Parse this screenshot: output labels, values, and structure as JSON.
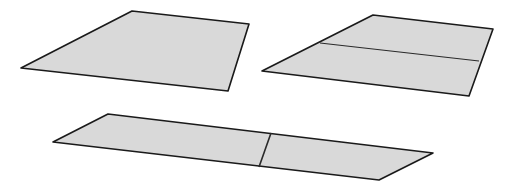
{
  "diagram": {
    "background": "#ffffff",
    "fill_color": "#d9d9d9",
    "stroke_color": "#1a1a1a",
    "shapes": [
      {
        "id": "sheet-whole",
        "points": "21,68 132,11 249,24 228,91",
        "divider": null
      },
      {
        "id": "sheet-halved-horizontal",
        "points": "262,71 373,15 493,29 469,96",
        "divider": {
          "x1": 320,
          "y1": 43,
          "x2": 479,
          "y2": 61,
          "width": 1.2
        }
      },
      {
        "id": "sheet-halved-vertical",
        "points": "53,142 108,114 433,153 379,180",
        "divider": {
          "x1": 271,
          "y1": 133,
          "x2": 259,
          "y2": 167,
          "width": 1.6
        }
      }
    ]
  }
}
